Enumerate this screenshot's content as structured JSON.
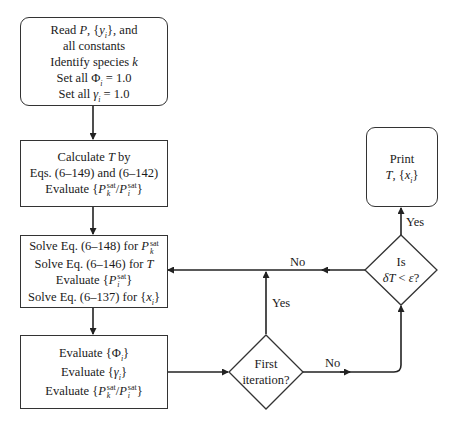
{
  "flowchart": {
    "start_box": {
      "lines": [
        "Read P, {y_i}, and",
        "all constants",
        "Identify species k",
        "Set all Φ_i = 1.0",
        "Set all γ_i = 1.0"
      ],
      "l1_pre": "Read ",
      "l1_var": "P",
      "l1_mid": ", {",
      "l1_set": "y",
      "l1_sub": "i",
      "l1_post": "}, and",
      "l2": "all constants",
      "l3_pre": "Identify species ",
      "l3_var": "k",
      "l4_pre": "Set all Φ",
      "l4_sub": "i",
      "l4_post": " = 1.0",
      "l5_pre": "Set all ",
      "l5_var": "γ",
      "l5_sub": "i",
      "l5_post": " = 1.0"
    },
    "calc_box": {
      "l1_pre": "Calculate ",
      "l1_var": "T",
      "l1_post": " by",
      "l2": "Eqs. (6–149) and (6–142)",
      "l3_pre": "Evaluate {",
      "l3_p1": "P",
      "l3_sup1": "sat",
      "l3_sub1": "k",
      "l3_slash": "/",
      "l3_p2": "P",
      "l3_sup2": "sat",
      "l3_sub2": "i",
      "l3_post": "}"
    },
    "solve_box": {
      "l1_pre": "Solve Eq. (6–148) for ",
      "l1_var": "P",
      "l1_sup": "sat",
      "l1_sub": "k",
      "l2_pre": "Solve Eq. (6–146) for ",
      "l2_var": "T",
      "l3_pre": "Evaluate {",
      "l3_var": "P",
      "l3_sup": "sat",
      "l3_sub": "i",
      "l3_post": "}",
      "l4_pre": "Solve Eq. (6–137) for {",
      "l4_var": "x",
      "l4_sub": "i",
      "l4_post": "}"
    },
    "eval_box": {
      "l1_pre": "Evaluate {Φ",
      "l1_sub": "i",
      "l1_post": "}",
      "l2_pre": "Evaluate {",
      "l2_var": "γ",
      "l2_sub": "i",
      "l2_post": "}",
      "l3_pre": "Evaluate  {",
      "l3_p1": "P",
      "l3_sup1": "sat",
      "l3_sub1": "k",
      "l3_slash": "/",
      "l3_p2": "P",
      "l3_sup2": "sat",
      "l3_sub2": "i",
      "l3_post": "}"
    },
    "first_iteration_decision": {
      "l1": "First",
      "l2": "iteration?"
    },
    "convergence_decision": {
      "l1": "Is",
      "l2_var": "δT",
      "l2_mid": " < ",
      "l2_eps": "ε",
      "l2_post": "?"
    },
    "print_box": {
      "l1": "Print",
      "l2_var": "T",
      "l2_mid": ", {",
      "l2_set": "x",
      "l2_sub": "i",
      "l2_post": "}"
    },
    "labels": {
      "yes_first_iteration": "Yes",
      "no_first_iteration": "No",
      "yes_convergence": "Yes",
      "no_convergence": "No"
    }
  }
}
